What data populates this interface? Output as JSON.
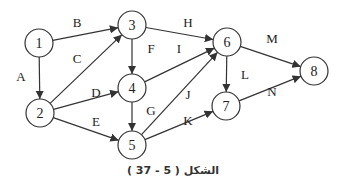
{
  "diagram": {
    "type": "directed-graph",
    "caption": "الشكل ( 5 - 37 )",
    "nodes": [
      {
        "id": "1",
        "label": "1",
        "x": 39,
        "y": 43
      },
      {
        "id": "2",
        "label": "2",
        "x": 40,
        "y": 113
      },
      {
        "id": "3",
        "label": "3",
        "x": 132,
        "y": 25
      },
      {
        "id": "4",
        "label": "4",
        "x": 132,
        "y": 88
      },
      {
        "id": "5",
        "label": "5",
        "x": 132,
        "y": 145
      },
      {
        "id": "6",
        "label": "6",
        "x": 227,
        "y": 42
      },
      {
        "id": "7",
        "label": "7",
        "x": 226,
        "y": 106
      },
      {
        "id": "8",
        "label": "8",
        "x": 314,
        "y": 71
      }
    ],
    "edges": [
      {
        "label": "A",
        "from": "1",
        "to": "2",
        "lx": 21,
        "ly": 76
      },
      {
        "label": "B",
        "from": "1",
        "to": "3",
        "lx": 77,
        "ly": 22
      },
      {
        "label": "C",
        "from": "2",
        "to": "3",
        "lx": 77,
        "ly": 58
      },
      {
        "label": "D",
        "from": "2",
        "to": "4",
        "lx": 96,
        "ly": 92
      },
      {
        "label": "E",
        "from": "2",
        "to": "5",
        "lx": 96,
        "ly": 121
      },
      {
        "label": "F",
        "from": "3",
        "to": "4",
        "lx": 151,
        "ly": 48
      },
      {
        "label": "G",
        "from": "4",
        "to": "5",
        "lx": 151,
        "ly": 110
      },
      {
        "label": "H",
        "from": "3",
        "to": "6",
        "lx": 188,
        "ly": 22
      },
      {
        "label": "I",
        "from": "4",
        "to": "6",
        "lx": 179,
        "ly": 48
      },
      {
        "label": "J",
        "from": "5",
        "to": "6",
        "lx": 188,
        "ly": 94
      },
      {
        "label": "K",
        "from": "5",
        "to": "7",
        "lx": 188,
        "ly": 120
      },
      {
        "label": "L",
        "from": "6",
        "to": "7",
        "lx": 245,
        "ly": 74
      },
      {
        "label": "M",
        "from": "6",
        "to": "8",
        "lx": 272,
        "ly": 38
      },
      {
        "label": "N",
        "from": "7",
        "to": "8",
        "lx": 272,
        "ly": 91
      }
    ]
  }
}
